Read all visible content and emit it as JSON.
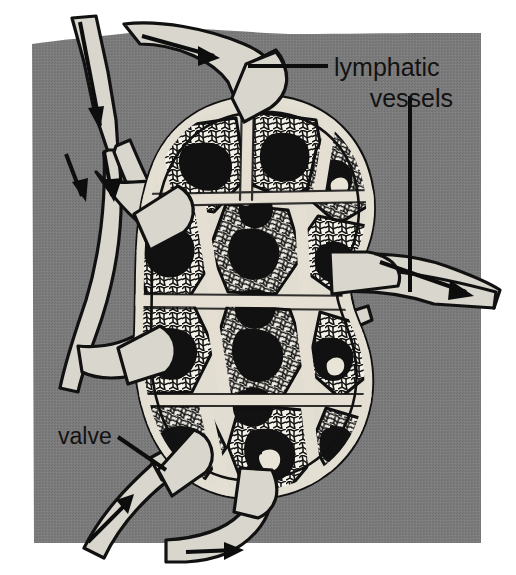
{
  "figure": {
    "name": "lymph-node-cross-section",
    "width": 516,
    "height": 575,
    "background_color": "#ffffff",
    "panel_color": "#7a7a7a",
    "vessel_fill": "#d9d6cd",
    "ink_color": "#111111",
    "capsule_fill": "#ded9cf",
    "parenchyma_fill": "#f2efe6",
    "germinal_center_fill": "#141414"
  },
  "labels": {
    "lymphatic_vessels": {
      "line1": "lymphatic",
      "line2": "vessels",
      "x": 334,
      "y": 76
    },
    "valve": {
      "text": "valve",
      "x": 60,
      "y": 442
    }
  },
  "leader_lines": [
    {
      "name": "lymphatic-vessels-upper-leader",
      "from_x": 328,
      "from_y": 66,
      "to_x": 248,
      "to_y": 66
    },
    {
      "name": "lymphatic-vessels-lower-leader",
      "from_x": 410,
      "from_y": 96,
      "to_x": 410,
      "to_y": 290
    },
    {
      "name": "valve-leader",
      "from_x": 118,
      "from_y": 438,
      "to_x": 163,
      "to_y": 468
    }
  ],
  "flow_arrows": [
    {
      "name": "afferent-arrow-top-left",
      "direction": "down",
      "note": "incoming lymph, upper left trunk"
    },
    {
      "name": "afferent-arrow-top-right",
      "direction": "right",
      "note": "incoming lymph, upper right trunk"
    },
    {
      "name": "afferent-arrow-left-upper",
      "direction": "down",
      "note": "incoming lymph, left branch"
    },
    {
      "name": "afferent-arrow-left-lower",
      "direction": "down",
      "note": "incoming lymph, left branch"
    },
    {
      "name": "efferent-arrow-right",
      "direction": "right",
      "note": "outgoing lymph at hilum"
    },
    {
      "name": "afferent-arrow-bottom-left",
      "direction": "up-right",
      "note": "incoming lymph, bottom left trunk"
    },
    {
      "name": "afferent-arrow-bottom-right",
      "direction": "right",
      "note": "incoming lymph, bottom right trunk"
    }
  ],
  "anatomy": {
    "node_outline": "kidney-bean shaped capsule with hilum indentation on the right",
    "compartments": 12,
    "features": [
      "capsule",
      "trabeculae",
      "cortical lobules with stippled lymphocyte texture",
      "dark germinal centres",
      "subcapsular sinus",
      "hilum"
    ]
  }
}
